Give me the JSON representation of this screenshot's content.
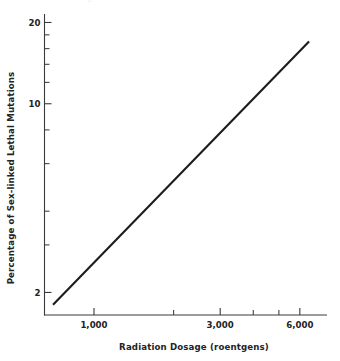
{
  "figure": {
    "ghost_caption_fragment": "ytv nf stvrlv",
    "background_color": "#ffffff",
    "line_color": "#1c1c1c",
    "axis_color": "#3a3a3c",
    "text_color": "#232326"
  },
  "chart_data": {
    "type": "line",
    "title": "",
    "subtitle": "",
    "xlabel": "Radiation Dosage (roentgens)",
    "ylabel": "Percentage of Sex-linked Lethal Mutations",
    "xscale": "log",
    "yscale": "log",
    "xlim": [
      650,
      7600
    ],
    "ylim": [
      1.65,
      21.5
    ],
    "grid": false,
    "legend": null,
    "legend_position": "none",
    "xticks_labeled": [
      {
        "value": 1000,
        "label": "1,000"
      },
      {
        "value": 3000,
        "label": "3,000"
      },
      {
        "value": 6000,
        "label": "6,000"
      }
    ],
    "xticks_unlabeled": [
      2000,
      4000,
      5000
    ],
    "yticks_labeled": [
      {
        "value": 20,
        "label": "20"
      },
      {
        "value": 10,
        "label": "10"
      },
      {
        "value": 2,
        "label": "2"
      }
    ],
    "yticks_unlabeled": [
      18,
      16,
      14,
      12,
      8,
      6,
      4,
      3
    ],
    "series": [
      {
        "name": "Sex-linked lethal mutations vs dosage",
        "x": [
          700,
          6500
        ],
        "values": [
          1.8,
          17.0
        ],
        "style": "solid",
        "color": "#1c1c1c",
        "width": 2.1
      }
    ],
    "annotations": []
  },
  "axes": {
    "x_tick_count": 6,
    "y_tick_count": 11
  }
}
